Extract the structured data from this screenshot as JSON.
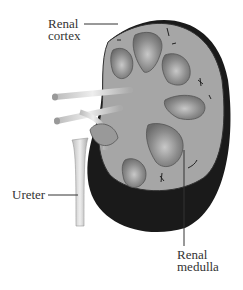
{
  "diagram": {
    "labels": {
      "cortex_line1": "Renal",
      "cortex_line2": "cortex",
      "ureter": "Ureter",
      "medulla_line1": "Renal",
      "medulla_line2": "medulla"
    },
    "colors": {
      "cortex": "#a9a9a9",
      "pyramid": "#8a8a8a",
      "capsule": "#1a1a1a",
      "ureter": "#d8d8d8"
    }
  }
}
